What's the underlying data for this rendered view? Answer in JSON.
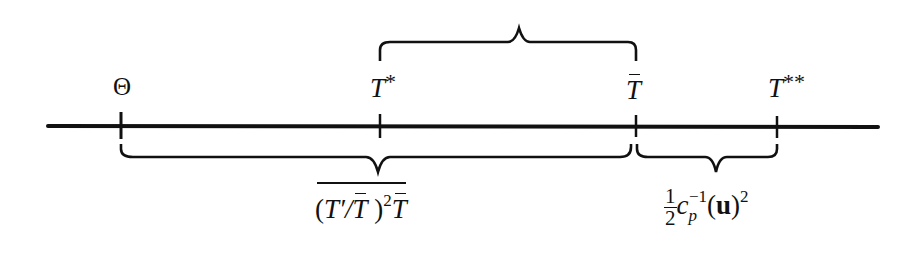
{
  "diagram": {
    "type": "number-line-with-braces",
    "axis": {
      "x_start": 48,
      "x_end": 878,
      "y": 126
    },
    "points": [
      {
        "id": "theta",
        "label": "Θ",
        "x": 121
      },
      {
        "id": "t_star",
        "label": "T*",
        "x": 380
      },
      {
        "id": "t_bar",
        "label": "T̄",
        "x": 636
      },
      {
        "id": "t_double_star",
        "label": "T**",
        "x": 777
      }
    ],
    "braces": [
      {
        "id": "top",
        "from": "t_star",
        "to": "t_bar",
        "side": "above",
        "label": ""
      },
      {
        "id": "bottom-long",
        "from": "theta",
        "to": "t_bar",
        "side": "below",
        "label": "(T′/T̄)² T̄ (overlined)"
      },
      {
        "id": "bottom-short",
        "from": "t_bar",
        "to": "t_double_star",
        "side": "below",
        "label": "½ c_p⁻¹ (u)²"
      }
    ]
  },
  "labels": {
    "theta": "Θ",
    "t": "T",
    "star1": "*",
    "star2": "**",
    "open_paren": "(",
    "close_paren": ")",
    "t_prime": "T′",
    "slash": "/",
    "sq": "2",
    "half_num": "1",
    "half_den": "2",
    "c": "c",
    "p": "p",
    "neg1": "−1",
    "u": "u"
  }
}
